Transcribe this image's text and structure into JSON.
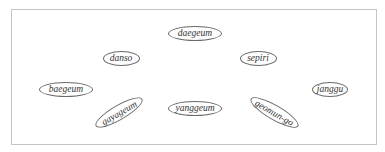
{
  "diagram": {
    "nodes": [
      {
        "id": "daegeum",
        "label": "daegeum",
        "cx": 195,
        "cy": 33,
        "w": 54,
        "h": 15,
        "rot": 0
      },
      {
        "id": "danso",
        "label": "danso",
        "cx": 121,
        "cy": 58,
        "w": 37,
        "h": 15,
        "rot": 0
      },
      {
        "id": "sepiri",
        "label": "sepiri",
        "cx": 258,
        "cy": 58,
        "w": 37,
        "h": 15,
        "rot": 0
      },
      {
        "id": "baegeum",
        "label": "baegeum",
        "cx": 66,
        "cy": 89,
        "w": 54,
        "h": 15,
        "rot": 0
      },
      {
        "id": "janggu",
        "label": "janggu",
        "cx": 330,
        "cy": 89,
        "w": 36,
        "h": 15,
        "rot": 0
      },
      {
        "id": "gayageum",
        "label": "gayageum",
        "cx": 119,
        "cy": 112,
        "w": 54,
        "h": 15,
        "rot": -30
      },
      {
        "id": "yanggeum",
        "label": "yanggeum",
        "cx": 195,
        "cy": 108,
        "w": 54,
        "h": 15,
        "rot": 0
      },
      {
        "id": "geomun-go",
        "label": "geomun-go",
        "cx": 274,
        "cy": 112,
        "w": 55,
        "h": 15,
        "rot": 30
      }
    ],
    "colors": {
      "frame_border": "#c4c4c4",
      "node_border": "#6a6a6a",
      "text": "#333333"
    }
  }
}
